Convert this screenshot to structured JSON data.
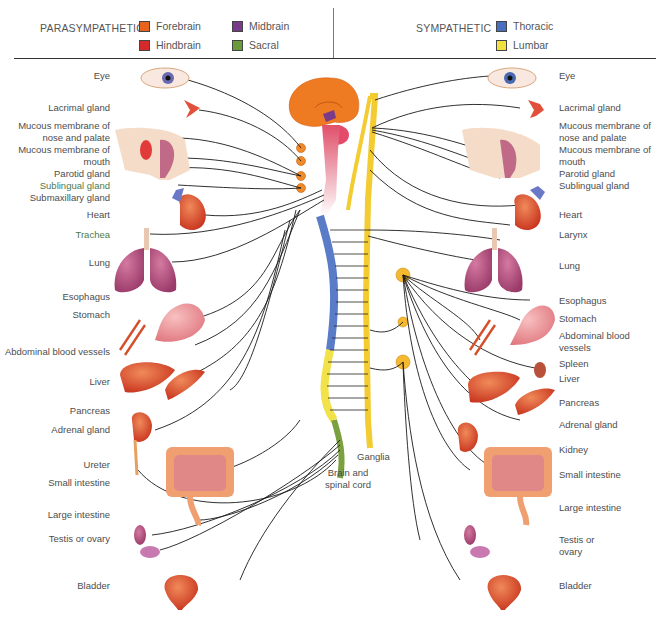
{
  "legend": {
    "parasympathetic": {
      "title": "PARASYMPATHETIC",
      "items": [
        {
          "label": "Forebrain",
          "color": "#e8641c"
        },
        {
          "label": "Midbrain",
          "color": "#7a3a8a"
        },
        {
          "label": "Hindbrain",
          "color": "#d42a2a"
        },
        {
          "label": "Sacral",
          "color": "#6a9a3a"
        }
      ]
    },
    "sympathetic": {
      "title": "SYMPATHETIC",
      "items": [
        {
          "label": "Thoracic",
          "color": "#4a6ec0"
        },
        {
          "label": "Lumbar",
          "color": "#f0e040"
        }
      ]
    }
  },
  "left_labels": [
    "Eye",
    "Lacrimal gland",
    "Mucous membrane of nose and palate",
    "Mucous membrane of mouth",
    "Parotid gland",
    "Sublingual gland",
    "Submaxillary gland",
    "Heart",
    "Trachea",
    "Lung",
    "Esophagus",
    "Stomach",
    "Abdominal blood vessels",
    "Liver",
    "Pancreas",
    "Adrenal gland",
    "Ureter",
    "Small intestine",
    "Large intestine",
    "Testis or ovary",
    "Bladder"
  ],
  "right_labels": [
    "Eye",
    "Lacrimal gland",
    "Mucous membrane of nose and palate",
    "Mucous membrane of mouth",
    "Parotid gland",
    "Sublingual gland",
    "Heart",
    "Larynx",
    "Lung",
    "Esophagus",
    "Stomach",
    "Abdominal blood vessels",
    "Spleen",
    "Liver",
    "Pancreas",
    "Adrenal gland",
    "Kidney",
    "Small intestine",
    "Large intestine",
    "Testis or ovary",
    "Bladder"
  ],
  "center_labels": {
    "ganglia": "Ganglia",
    "brain_spinal_cord": "Brain and spinal cord"
  },
  "colors": {
    "nerve": "#1a1a1a",
    "ganglion": "#f5b82e",
    "para_ganglion": "#f08a2a",
    "organ_red": "#d94a2a",
    "organ_pink": "#b8527a"
  }
}
